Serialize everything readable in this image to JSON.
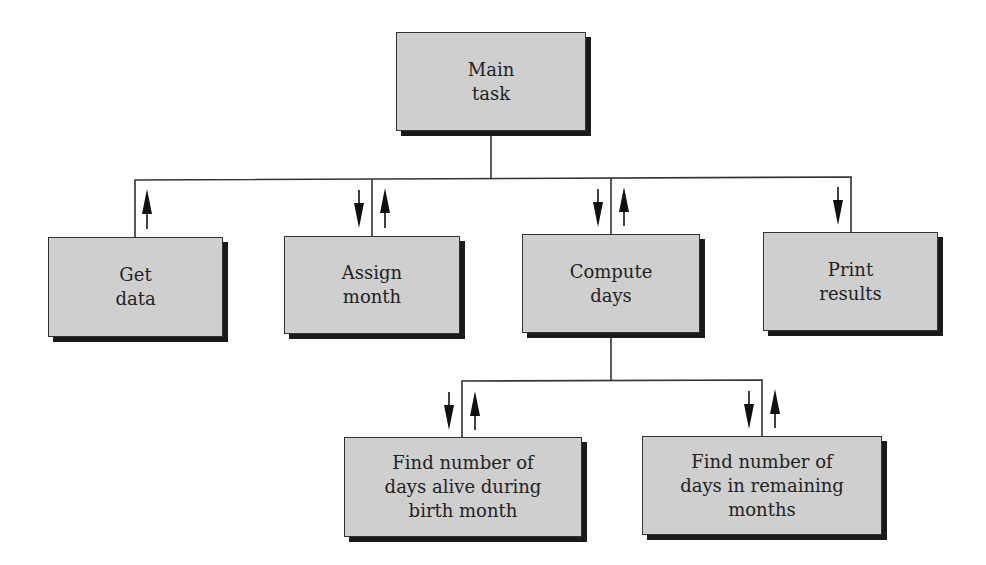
{
  "diagram": {
    "type": "structure chart",
    "root": {
      "label": "Main\ntask"
    },
    "level1": [
      {
        "label": "Get\ndata",
        "arrows": [
          "up"
        ]
      },
      {
        "label": "Assign\nmonth",
        "arrows": [
          "down",
          "up"
        ]
      },
      {
        "label": "Compute\ndays",
        "arrows": [
          "down",
          "up"
        ]
      },
      {
        "label": "Print\nresults",
        "arrows": [
          "down"
        ]
      }
    ],
    "level2": [
      {
        "parent": "Compute days",
        "label": "Find number of\ndays alive during\nbirth month",
        "arrows": [
          "down",
          "up"
        ]
      },
      {
        "parent": "Compute days",
        "label": "Find number of\ndays in remaining\nmonths",
        "arrows": [
          "down",
          "up"
        ]
      }
    ],
    "colors": {
      "box_fill": "#cfcfcf",
      "shadow": "#1a1a1a",
      "line": "#333333"
    }
  }
}
